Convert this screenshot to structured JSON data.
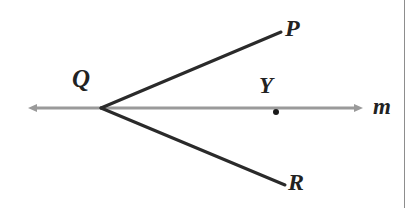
{
  "figure": {
    "kind": "geometry-diagram",
    "background_color": "#ffffff",
    "width": 417,
    "height": 208,
    "line": {
      "name": "m",
      "label": "m",
      "color": "#9a9a9a",
      "stroke_width": 3,
      "y": 108,
      "x_start": 28,
      "x_end": 363,
      "arrowheads": "both",
      "label_position": {
        "x": 378,
        "y": 108
      }
    },
    "vertex": {
      "name": "Q",
      "label": "Q",
      "x": 101,
      "y": 108,
      "label_position": {
        "x": 78,
        "y": 82
      }
    },
    "rays": [
      {
        "name": "ray-QP",
        "endpoint_label": "P",
        "color": "#2a2a2a",
        "stroke_width": 3,
        "from": {
          "x": 101,
          "y": 108
        },
        "to": {
          "x": 281,
          "y": 32
        },
        "label_position": {
          "x": 291,
          "y": 29
        }
      },
      {
        "name": "ray-QR",
        "endpoint_label": "R",
        "color": "#2a2a2a",
        "stroke_width": 3,
        "from": {
          "x": 101,
          "y": 108
        },
        "to": {
          "x": 285,
          "y": 185
        },
        "label_position": {
          "x": 294,
          "y": 183
        }
      }
    ],
    "points": [
      {
        "name": "Y",
        "label": "Y",
        "x": 276,
        "y": 112,
        "radius": 3,
        "color": "#1a1a1a",
        "label_position": {
          "x": 266,
          "y": 86
        }
      }
    ],
    "page_edge": {
      "name": "page-edge",
      "x": 404,
      "color": "#8d8d8d"
    }
  },
  "labels": {
    "Q": "Q",
    "P": "P",
    "R": "R",
    "Y": "Y",
    "m": "m"
  }
}
